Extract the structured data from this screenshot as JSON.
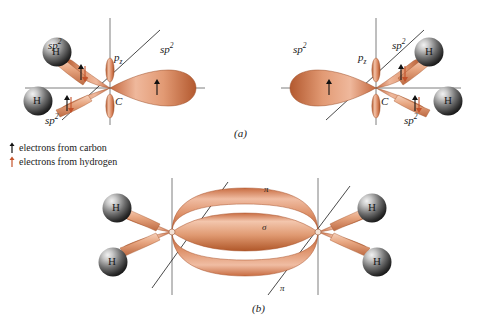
{
  "figure": {
    "background_color": "#ffffff",
    "lobe_color_light": "#f0b79b",
    "lobe_color_mid": "#dd8f68",
    "lobe_color_dark": "#b55c33",
    "sphere_color_light": "#d8d8d8",
    "sphere_color_dark": "#2a2a2a",
    "axis_color": "#6f6f6f",
    "diagonal_color": "#1a1a1a",
    "text_color": "#1a1a1a",
    "carbon_arrow_color": "#111111",
    "hydrogen_arrow_color": "#c4522a"
  },
  "panel_a": {
    "caption": "(a)",
    "left_atom": {
      "center_label": "C",
      "pz_label": "p",
      "pz_subscript": "z",
      "hybrid_label": "sp",
      "hybrid_superscript": "2",
      "hydrogen_label": "H",
      "hydrogen_count": 2,
      "lobe_labels": [
        "sp2",
        "sp2",
        "sp2"
      ],
      "hydrogens": [
        "H",
        "H"
      ]
    },
    "right_atom": {
      "center_label": "C",
      "pz_label": "p",
      "pz_subscript": "z",
      "hybrid_label": "sp",
      "hybrid_superscript": "2",
      "hydrogen_label": "H",
      "hydrogen_count": 2,
      "lobe_labels": [
        "sp2",
        "sp2",
        "sp2"
      ],
      "hydrogens": [
        "H",
        "H"
      ]
    }
  },
  "panel_b": {
    "caption": "(b)",
    "sigma_label": "σ",
    "pi_label_top": "π",
    "pi_label_bottom": "π",
    "hydrogens": [
      "H",
      "H",
      "H",
      "H"
    ],
    "hydrogen_count": 4,
    "carbon_count": 2
  },
  "legend": {
    "items": [
      {
        "label": "electrons from carbon",
        "arrow_color": "#111111",
        "icon": "up-arrow-icon"
      },
      {
        "label": "electrons from hydrogen",
        "arrow_color": "#c4522a",
        "icon": "up-arrow-icon"
      }
    ]
  }
}
